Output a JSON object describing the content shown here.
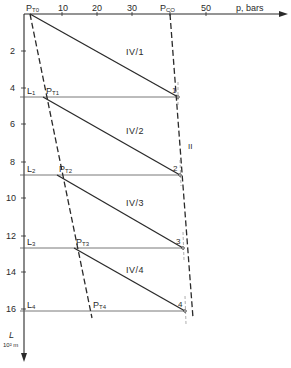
{
  "diagram": {
    "x_axis": {
      "label": "p, bars",
      "ticks": [
        {
          "value": "10",
          "x": 62
        },
        {
          "value": "20",
          "x": 97
        },
        {
          "value": "30",
          "x": 132
        },
        {
          "value": "50",
          "x": 206
        }
      ],
      "origin_label": {
        "main": "P",
        "sub": "T0"
      },
      "pco_label": {
        "main": "P",
        "sub": "CO"
      }
    },
    "y_axis": {
      "label_main": "L",
      "label_unit": "10² m",
      "ticks": [
        {
          "value": "2",
          "y": 51
        },
        {
          "value": "4",
          "y": 88
        },
        {
          "value": "6",
          "y": 124
        },
        {
          "value": "8",
          "y": 162
        },
        {
          "value": "10",
          "y": 198
        },
        {
          "value": "12",
          "y": 236
        },
        {
          "value": "14",
          "y": 272
        },
        {
          "value": "16",
          "y": 309
        }
      ]
    },
    "levels": [
      {
        "label": "L",
        "sub": "1",
        "pt_main": "P",
        "pt_sub": "T1",
        "point_num": "1",
        "region": "IV/1"
      },
      {
        "label": "L",
        "sub": "2",
        "pt_main": "P",
        "pt_sub": "T2",
        "point_num": "2",
        "region": "IV/2"
      },
      {
        "label": "L",
        "sub": "3",
        "pt_main": "P",
        "pt_sub": "T3",
        "point_num": "3",
        "region": "IV/3"
      },
      {
        "label": "L",
        "sub": "4",
        "pt_main": "P",
        "pt_sub": "T4",
        "point_num": "4",
        "region": "IV/4"
      }
    ],
    "curve_label": "II",
    "colors": {
      "ink": "#2a2a2a",
      "thin": "#555555",
      "background": "#ffffff"
    }
  }
}
